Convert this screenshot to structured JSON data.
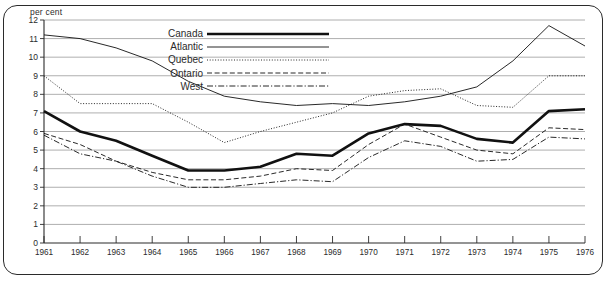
{
  "axis": {
    "unit_label": "per cent",
    "y_ticks": [
      "12",
      "11",
      "10",
      "9",
      "8",
      "7",
      "6",
      "5",
      "4",
      "3",
      "2",
      "1",
      "0"
    ],
    "x_ticks": [
      "1961",
      "1962",
      "1963",
      "1964",
      "1965",
      "1966",
      "1967",
      "1968",
      "1969",
      "1970",
      "1971",
      "1972",
      "1973",
      "1974",
      "1975",
      "1976"
    ]
  },
  "legend": {
    "items": [
      {
        "label": "Canada",
        "style": "thick-solid"
      },
      {
        "label": "Atlantic",
        "style": "thin-solid"
      },
      {
        "label": "Quebec",
        "style": "dotted"
      },
      {
        "label": "Ontario",
        "style": "dashed"
      },
      {
        "label": "West",
        "style": "dash-dot"
      }
    ]
  },
  "colors": {
    "line": "#111111",
    "grid": "#9a9a9a",
    "axis": "#2b2b2b",
    "frame": "#2b2b2b",
    "background": "#ffffff"
  },
  "chart_data": {
    "type": "line",
    "title": "",
    "subtitle": "",
    "xlabel": "",
    "ylabel": "per cent",
    "ylim": [
      0,
      12
    ],
    "grid": true,
    "legend_position": "top-center",
    "x": [
      1961,
      1962,
      1963,
      1964,
      1965,
      1966,
      1967,
      1968,
      1969,
      1970,
      1971,
      1972,
      1973,
      1974,
      1975,
      1976
    ],
    "categories": [
      "1961",
      "1962",
      "1963",
      "1964",
      "1965",
      "1966",
      "1967",
      "1968",
      "1969",
      "1970",
      "1971",
      "1972",
      "1973",
      "1974",
      "1975",
      "1976"
    ],
    "series": [
      {
        "name": "Canada",
        "style": "thick-solid",
        "values": [
          7.1,
          6.0,
          5.5,
          4.7,
          3.9,
          3.9,
          4.1,
          4.8,
          4.7,
          5.9,
          6.4,
          6.3,
          5.6,
          5.4,
          7.1,
          7.2
        ]
      },
      {
        "name": "Atlantic",
        "style": "thin-solid",
        "values": [
          11.2,
          11.0,
          10.5,
          9.8,
          8.7,
          7.9,
          7.6,
          7.4,
          7.5,
          7.4,
          7.6,
          7.9,
          8.4,
          9.8,
          11.7,
          10.6
        ]
      },
      {
        "name": "Quebec",
        "style": "dotted",
        "values": [
          9.0,
          7.5,
          7.5,
          7.5,
          6.5,
          5.4,
          6.0,
          6.5,
          7.0,
          7.9,
          8.2,
          8.3,
          7.4,
          7.3,
          9.0,
          9.0
        ]
      },
      {
        "name": "Ontario",
        "style": "dashed",
        "values": [
          5.9,
          5.3,
          4.4,
          3.8,
          3.4,
          3.4,
          3.6,
          4.0,
          3.9,
          5.3,
          6.4,
          5.7,
          5.0,
          4.8,
          6.2,
          6.1
        ]
      },
      {
        "name": "West",
        "style": "dash-dot",
        "values": [
          5.8,
          4.8,
          4.4,
          3.6,
          3.0,
          3.0,
          3.2,
          3.4,
          3.3,
          4.6,
          5.5,
          5.2,
          4.4,
          4.5,
          5.7,
          5.6
        ]
      }
    ]
  }
}
